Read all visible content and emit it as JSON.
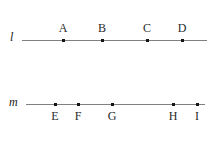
{
  "figure": {
    "background_color": "#ffffff",
    "line_color": "#808080",
    "point_color": "#141414",
    "label_color": "#2b2b2b",
    "lines": [
      {
        "name": "l",
        "label_x": 10,
        "label_y": 31,
        "y": 40,
        "x_start": 22,
        "x_end": 207,
        "label_position": "above",
        "points": [
          {
            "label": "A",
            "x": 63
          },
          {
            "label": "B",
            "x": 102
          },
          {
            "label": "C",
            "x": 147
          },
          {
            "label": "D",
            "x": 182
          }
        ]
      },
      {
        "name": "m",
        "label_x": 9,
        "label_y": 96,
        "y": 104,
        "x_start": 26,
        "x_end": 205,
        "label_position": "below",
        "points": [
          {
            "label": "E",
            "x": 55
          },
          {
            "label": "F",
            "x": 78
          },
          {
            "label": "G",
            "x": 112
          },
          {
            "label": "H",
            "x": 173
          },
          {
            "label": "I",
            "x": 197
          }
        ]
      }
    ]
  }
}
